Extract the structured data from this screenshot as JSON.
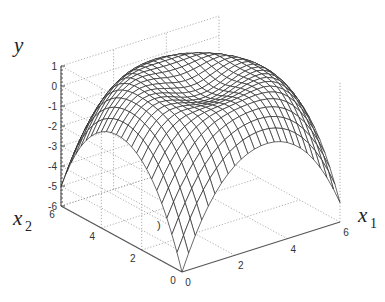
{
  "chart_data": {
    "type": "surface-mesh-3d",
    "title": "",
    "axes": {
      "x1": {
        "label": "x",
        "subscript": "1",
        "ticks": [
          0,
          2,
          4,
          6
        ],
        "range": [
          0,
          6
        ]
      },
      "x2": {
        "label": "x",
        "subscript": "2",
        "ticks": [
          0,
          2,
          4,
          6
        ],
        "range": [
          0,
          6
        ]
      },
      "y": {
        "label": "y",
        "ticks": [
          1,
          0,
          -1,
          -2,
          -3,
          -4,
          -5,
          -6
        ],
        "range": [
          -6,
          1
        ]
      }
    },
    "grid": true,
    "surface": {
      "grid_lines": 25,
      "center": [
        3,
        3
      ],
      "center_value": 0,
      "ring_radius": 1.8,
      "ring_peak": 0.7,
      "outer_curvature": 0.96,
      "front_tilt": -1.0,
      "corner_values": {
        "x1=0,x2=0": -6,
        "x1=6,x2=0": -5,
        "x1=0,x2=6": -5
      }
    },
    "stray_glyph": ")"
  },
  "colors": {
    "mesh": "#2a2a2a",
    "grid": "#9a9a9a",
    "axis": "#555555",
    "background": "#ffffff"
  }
}
